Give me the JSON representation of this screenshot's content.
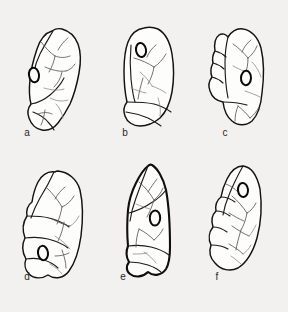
{
  "figure": {
    "kind": "scientific-illustration-plate",
    "subject": "perforated elongate artifacts shown in line drawing",
    "panel_count": 6,
    "columns": 3,
    "rows": 2,
    "background_color": "#f2f1ef",
    "outline_color": "#15120f",
    "crack_color": "#5d5954",
    "interior_fill": "#fdfdfc",
    "perforation_stroke": "#0b0907"
  },
  "panels": [
    {
      "id": "a",
      "label": "a",
      "label_x": 27,
      "label_y": 136,
      "row": 1,
      "column": 1,
      "orientation": "tilted-right, narrow tapering tip at top",
      "perforation": {
        "cx": 34,
        "cy": 75,
        "rx": 5.0,
        "ry": 7.4,
        "rotate": -8
      },
      "outline_weight": "normal"
    },
    {
      "id": "b",
      "label": "b",
      "label_x": 125,
      "label_y": 136,
      "row": 1,
      "column": 2,
      "orientation": "upright oval, blunt lobed base",
      "perforation": {
        "cx": 141,
        "cy": 50,
        "rx": 5.0,
        "ry": 7.0,
        "rotate": -10
      },
      "outline_weight": "normal"
    },
    {
      "id": "c",
      "label": "c",
      "label_x": 225,
      "label_y": 136,
      "row": 1,
      "column": 3,
      "orientation": "upright, stepped notches on left margin",
      "perforation": {
        "cx": 246,
        "cy": 78,
        "rx": 5.0,
        "ry": 7.2,
        "rotate": 4
      },
      "outline_weight": "normal"
    },
    {
      "id": "d",
      "label": "d",
      "label_x": 27,
      "label_y": 280,
      "row": 2,
      "column": 1,
      "orientation": "upright, perforation low on body",
      "perforation": {
        "cx": 43,
        "cy": 253,
        "rx": 5.0,
        "ry": 7.2,
        "rotate": -8
      },
      "outline_weight": "normal"
    },
    {
      "id": "e",
      "label": "e",
      "label_x": 123,
      "label_y": 280,
      "row": 2,
      "column": 2,
      "orientation": "pointed apex, heavy dark outline, lobed base",
      "perforation": {
        "cx": 155,
        "cy": 218,
        "rx": 5.2,
        "ry": 7.6,
        "rotate": 2
      },
      "outline_weight": "heavy"
    },
    {
      "id": "f",
      "label": "f",
      "label_x": 217,
      "label_y": 280,
      "row": 2,
      "column": 3,
      "orientation": "tilted, perforation high on body, stepped left margin",
      "perforation": {
        "cx": 243,
        "cy": 190,
        "rx": 5.0,
        "ry": 7.0,
        "rotate": -6
      },
      "outline_weight": "normal"
    }
  ]
}
